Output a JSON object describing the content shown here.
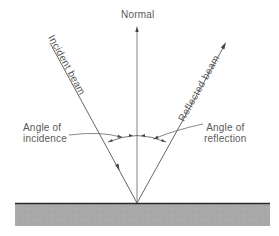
{
  "diagram": {
    "normal_label": "Normal",
    "incident_label": "Incident beam",
    "reflected_label": "Reflected beam",
    "angle_incidence_line1": "Angle of",
    "angle_incidence_line2": "incidence",
    "angle_reflection_line1": "Angle of",
    "angle_reflection_line2": "reflection"
  },
  "colors": {
    "line": "#555555",
    "surface_edge": "#2a2a2a",
    "surface_fill": "#a8a8a8",
    "text": "#5a5a5a"
  }
}
